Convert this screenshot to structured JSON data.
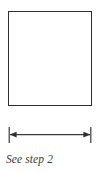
{
  "figure": {
    "background_color": "#ffffff",
    "line_color": "#2e2e2e",
    "caption": "See step 2",
    "shape": {
      "name": "square",
      "fill": "#ffffff",
      "stroke": "#2e2e2e"
    },
    "dimension": {
      "label": "",
      "arrow_style": "double-headed",
      "tick_style": "extension-lines"
    }
  }
}
